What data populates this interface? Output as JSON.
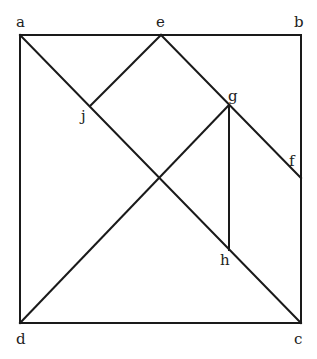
{
  "diagram": {
    "type": "geometric-figure",
    "stroke_color": "#1a1a1a",
    "background": "#ffffff",
    "points": {
      "a": {
        "label": "a",
        "x": 20,
        "y": 35,
        "lx": 16,
        "ly": 27
      },
      "b": {
        "label": "b",
        "x": 301,
        "y": 35,
        "lx": 294,
        "ly": 27
      },
      "c": {
        "label": "c",
        "x": 301,
        "y": 323,
        "lx": 294,
        "ly": 344
      },
      "d": {
        "label": "d",
        "x": 20,
        "y": 323,
        "lx": 16,
        "ly": 344
      },
      "e": {
        "label": "e",
        "x": 161,
        "y": 35,
        "lx": 156,
        "ly": 27
      },
      "f": {
        "label": "f",
        "x": 301,
        "y": 178,
        "lx": 289,
        "ly": 166
      },
      "g": {
        "label": "g",
        "x": 229,
        "y": 105,
        "lx": 228,
        "ly": 101
      },
      "h": {
        "label": "h",
        "x": 229,
        "y": 250,
        "lx": 220,
        "ly": 265
      },
      "j": {
        "label": "j",
        "x": 90,
        "y": 106,
        "lx": 81,
        "ly": 121
      }
    },
    "segments": [
      [
        "a",
        "b"
      ],
      [
        "b",
        "c"
      ],
      [
        "c",
        "d"
      ],
      [
        "d",
        "a"
      ],
      [
        "a",
        "c"
      ],
      [
        "e",
        "j"
      ],
      [
        "e",
        "f"
      ],
      [
        "d",
        "g"
      ],
      [
        "g",
        "h"
      ]
    ]
  }
}
